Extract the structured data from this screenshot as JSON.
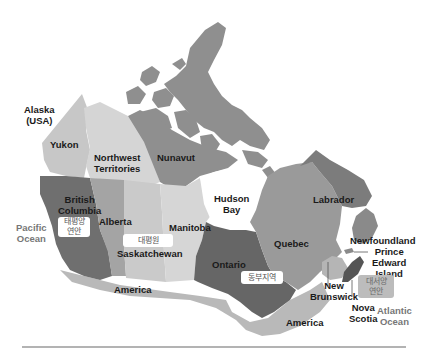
{
  "map": {
    "title": "Canada provinces and regions",
    "colors": {
      "background": "#ffffff",
      "yukon": "#c7c7c7",
      "northwest_territories": "#d5d5d5",
      "nunavut": "#8f8f8f",
      "british_columbia": "#6f6f6f",
      "alberta": "#a4a4a4",
      "saskatchewan": "#cacaca",
      "manitoba": "#d6d6d6",
      "ontario": "#666666",
      "quebec": "#9a9a9a",
      "labrador": "#7c7c7c",
      "newfoundland": "#8a8a8a",
      "maritimes": "#b5b5b5",
      "nova_scotia": "#555555",
      "usa": "#b9b9b9",
      "water_label": "#777777",
      "rule": "#9a9a9a"
    },
    "labels": {
      "alaska": "Alaska",
      "alaska_sub": "(USA)",
      "yukon": "Yukon",
      "northwest_1": "Northwest",
      "northwest_2": "Territories",
      "nunavut": "Nunavut",
      "british_1": "British",
      "british_2": "Columbia",
      "alberta": "Alberta",
      "saskatchewan": "Saskatchewan",
      "manitoba": "Manitoba",
      "hudson_1": "Hudson",
      "hudson_2": "Bay",
      "ontario": "Ontario",
      "quebec": "Quebec",
      "labrador": "Labrador",
      "newfoundland": "Newfoundland",
      "pei_1": "Prince",
      "pei_2": "Edward",
      "pei_3": "Island",
      "new_brunswick_1": "New",
      "new_brunswick_2": "Brunswick",
      "nova_scotia_1": "Nova",
      "nova_scotia_2": "Scotia",
      "pacific_1": "Pacific",
      "pacific_2": "Ocean",
      "atlantic_1": "Atlantic",
      "atlantic_2": "Ocean",
      "america_west": "America",
      "america_east": "America"
    },
    "regions": {
      "pacific_coast_1": "태평양",
      "pacific_coast_2": "연안",
      "great_plains": "대평원",
      "eastern": "동부지역",
      "atlantic_coast_1": "대서양",
      "atlantic_coast_2": "연안"
    }
  }
}
